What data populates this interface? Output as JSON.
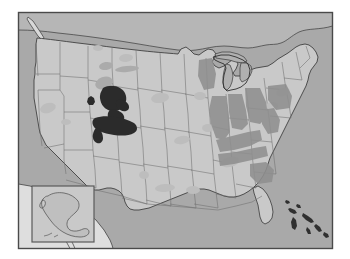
{
  "figure": {
    "kind": "choropleth-map",
    "title": "",
    "caption": "",
    "region": "United States",
    "projection": "albers-like",
    "has_frame": true,
    "frame": {
      "x": 18,
      "y": 12,
      "width": 315,
      "height": 237,
      "stroke": "#4a4a4a",
      "stroke_width": 1.4
    }
  },
  "palette": {
    "ocean": "#a9a9a9",
    "land_base": "#c9c9c9",
    "land_light": "#d2d2d2",
    "foreign_land": "#dedede",
    "state_border": "#6e6e6e",
    "coast_outline": "#3a3a3a",
    "shade_light": "#bdbdbd",
    "shade_medium": "#ababab",
    "shade_dark": "#8f8f8f",
    "highlight_black": "#2b2b2b",
    "inset_border": "#5a5a5a",
    "page_background": "#ffffff"
  },
  "legend": {
    "present": false,
    "entries": [
      {
        "label": "highlighted occurrence",
        "color": "#2b2b2b"
      },
      {
        "label": "moderate density",
        "color": "#8f8f8f"
      },
      {
        "label": "low density",
        "color": "#bdbdbd"
      },
      {
        "label": "no data",
        "color": "#c9c9c9"
      }
    ]
  },
  "insets": [
    {
      "name": "alaska-inset",
      "label": "",
      "x": 32,
      "y": 186,
      "width": 62,
      "height": 56,
      "border_color": "#5a5a5a",
      "fill": "#c9c9c9"
    }
  ],
  "annotations": [],
  "labels": [],
  "chart_data": {
    "type": "heatmap",
    "title": "",
    "xlabel": "",
    "ylabel": "",
    "regions": [
      {
        "name": "Utah",
        "shade": "highlight_black",
        "intensity": 1.0
      },
      {
        "name": "Colorado",
        "shade": "highlight_black",
        "intensity": 0.92
      },
      {
        "name": "Nevada",
        "shade": "shade_light",
        "intensity": 0.22
      },
      {
        "name": "Montana",
        "shade": "shade_medium",
        "intensity": 0.4
      },
      {
        "name": "Wyoming",
        "shade": "shade_medium",
        "intensity": 0.38
      },
      {
        "name": "North Dakota",
        "shade": "shade_light",
        "intensity": 0.18
      },
      {
        "name": "South Dakota",
        "shade": "shade_light",
        "intensity": 0.2
      },
      {
        "name": "Nebraska",
        "shade": "shade_light",
        "intensity": 0.16
      },
      {
        "name": "Kansas",
        "shade": "shade_light",
        "intensity": 0.14
      },
      {
        "name": "Missouri",
        "shade": "shade_light",
        "intensity": 0.24
      },
      {
        "name": "Illinois",
        "shade": "shade_dark",
        "intensity": 0.55
      },
      {
        "name": "Indiana",
        "shade": "shade_dark",
        "intensity": 0.58
      },
      {
        "name": "Ohio",
        "shade": "shade_dark",
        "intensity": 0.6
      },
      {
        "name": "Kentucky",
        "shade": "shade_dark",
        "intensity": 0.52
      },
      {
        "name": "Tennessee",
        "shade": "shade_medium",
        "intensity": 0.42
      },
      {
        "name": "West Virginia",
        "shade": "shade_dark",
        "intensity": 0.5
      },
      {
        "name": "Pennsylvania",
        "shade": "shade_medium",
        "intensity": 0.36
      },
      {
        "name": "New York",
        "shade": "shade_light",
        "intensity": 0.2
      },
      {
        "name": "Texas",
        "shade": "shade_light",
        "intensity": 0.18
      },
      {
        "name": "Oklahoma",
        "shade": "shade_light",
        "intensity": 0.15
      },
      {
        "name": "Arkansas",
        "shade": "shade_light",
        "intensity": 0.17
      },
      {
        "name": "Mississippi",
        "shade": "shade_light",
        "intensity": 0.15
      },
      {
        "name": "Alabama",
        "shade": "shade_light",
        "intensity": 0.16
      },
      {
        "name": "Georgia",
        "shade": "shade_light",
        "intensity": 0.14
      },
      {
        "name": "Florida",
        "shade": "land_base",
        "intensity": 0.05
      },
      {
        "name": "California",
        "shade": "shade_light",
        "intensity": 0.12
      },
      {
        "name": "Oregon",
        "shade": "land_base",
        "intensity": 0.06
      },
      {
        "name": "Washington",
        "shade": "land_base",
        "intensity": 0.06
      },
      {
        "name": "Idaho",
        "shade": "shade_medium",
        "intensity": 0.35
      },
      {
        "name": "Arizona",
        "shade": "land_base",
        "intensity": 0.08
      },
      {
        "name": "New Mexico",
        "shade": "land_base",
        "intensity": 0.08
      },
      {
        "name": "Alaska",
        "shade": "land_base",
        "intensity": 0.05
      }
    ]
  }
}
